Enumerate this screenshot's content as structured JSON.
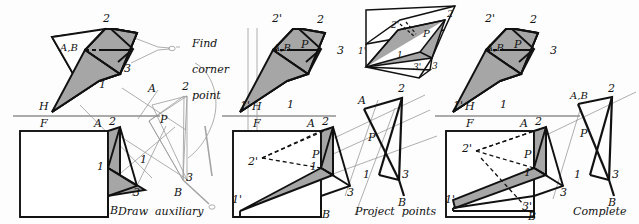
{
  "figure": {
    "background_color": "#fdfdfd",
    "ink_color": "#111111",
    "construction_line_color": "#8d8d8d",
    "shaded_face_color": "#a6a6a6",
    "panel_count": 3
  },
  "panels": [
    {
      "id": "panel-1",
      "caption": "Draw auxiliary view",
      "annotation": "Find corner point",
      "views": [
        {
          "name": "top-view",
          "labels": [
            "2",
            "A,B",
            "3",
            "1",
            "H"
          ]
        },
        {
          "name": "front-view",
          "labels": [
            "F",
            "A",
            "2",
            "1",
            "3",
            "B"
          ]
        },
        {
          "name": "auxiliary-view",
          "labels": [
            "A",
            "2",
            "P",
            "1",
            "3",
            "B"
          ]
        }
      ]
    },
    {
      "id": "panel-2",
      "caption": "Project points back to views",
      "views": [
        {
          "name": "top-view",
          "labels": [
            "2'",
            "2",
            "P",
            "A,B",
            "3",
            "1'",
            "1",
            "H"
          ]
        },
        {
          "name": "pictorial-inset",
          "labels": [
            "2'",
            "2",
            "P",
            "1'",
            "1",
            "3'",
            "3"
          ]
        },
        {
          "name": "front-view",
          "labels": [
            "F",
            "A",
            "2",
            "2'",
            "P",
            "1",
            "1'",
            "3",
            "B"
          ]
        },
        {
          "name": "auxiliary-view",
          "labels": [
            "A",
            "2",
            "P",
            "1",
            "3",
            "B"
          ]
        }
      ]
    },
    {
      "id": "panel-3",
      "caption": "Complete views",
      "views": [
        {
          "name": "top-view",
          "labels": [
            "2'",
            "2",
            "P",
            "A,B",
            "3",
            "1'",
            "1",
            "H"
          ]
        },
        {
          "name": "front-view",
          "labels": [
            "F",
            "A",
            "2",
            "2'",
            "P",
            "1",
            "1'",
            "3",
            "3'",
            "B"
          ]
        },
        {
          "name": "auxiliary-view",
          "labels": [
            "A,B",
            "2",
            "P",
            "1",
            "3",
            "B"
          ]
        }
      ]
    }
  ],
  "text": {
    "find_corner_point": "Find\ncorner\npoint",
    "find_corner_point_lines": [
      "Find",
      "corner",
      "point"
    ],
    "draw_auxiliary_view_lines": [
      "Draw  auxiliary",
      "view"
    ],
    "project_points_lines": [
      "Project  points",
      "back  to  views"
    ],
    "complete_views_lines": [
      "Complete",
      "views"
    ]
  },
  "marks": {
    "H": "H",
    "F": "F",
    "A": "A",
    "B": "B",
    "P": "P",
    "AB": "A,B",
    "one": "1",
    "two": "2",
    "three": "3",
    "one_p": "1'",
    "two_p": "2'",
    "three_p": "3'"
  }
}
